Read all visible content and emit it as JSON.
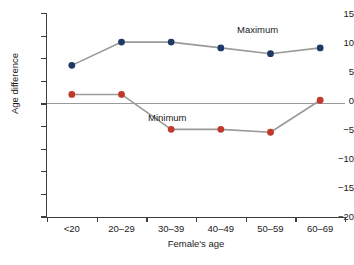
{
  "chart_data": {
    "type": "line",
    "title": "",
    "xlabel": "Female's age",
    "ylabel": "Age difference",
    "categories": [
      "<20",
      "20–29",
      "30–39",
      "40–49",
      "50–59",
      "60–69"
    ],
    "ylim": [
      -20,
      15
    ],
    "yticks": [
      15,
      10,
      5,
      0,
      -5,
      -10,
      -15,
      -20
    ],
    "ytick_labels": [
      "15",
      "10",
      "5",
      "0",
      "−5",
      "−10",
      "−15",
      "−20"
    ],
    "grid": false,
    "legend_position": "inline-annotations",
    "reference_lines": [
      {
        "axis": "y",
        "value": 0,
        "color": "#9a9a9a"
      }
    ],
    "series": [
      {
        "name": "Maximum",
        "color": "#1f3864",
        "line_color": "#9a9a9a",
        "values": [
          6,
          10,
          10,
          9,
          8,
          9
        ]
      },
      {
        "name": "Minimum",
        "color": "#c0392b",
        "line_color": "#9a9a9a",
        "values": [
          1,
          1,
          -5,
          -5,
          -5.5,
          0
        ]
      }
    ],
    "annotations": [
      {
        "text": "Maximum",
        "series": "Maximum"
      },
      {
        "text": "Minimum",
        "series": "Minimum"
      }
    ]
  },
  "axis": {
    "y_title": "Age difference",
    "x_title": "Female's age",
    "y_labels": [
      "15",
      "10",
      "5",
      "0",
      "−5",
      "−10",
      "−15",
      "−20"
    ],
    "x_labels": [
      "<20",
      "20–29",
      "30–39",
      "40–49",
      "50–59",
      "60–69"
    ]
  },
  "labels": {
    "maximum": "Maximum",
    "minimum": "Minimum"
  },
  "colors": {
    "maximum_marker": "#1f3864",
    "minimum_marker": "#c0392b",
    "line": "#9a9a9a",
    "axis": "#3d3d3d",
    "zero_line": "#9a9a9a"
  }
}
